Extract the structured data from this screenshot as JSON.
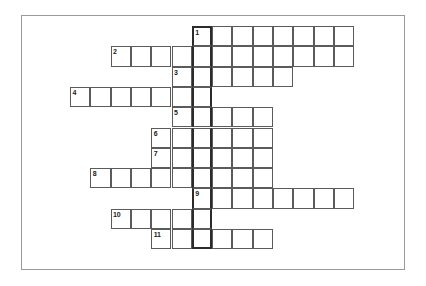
{
  "puzzle": {
    "type": "crossword-skeleton",
    "title": "",
    "grid": {
      "cell_size": 20.3,
      "origin_x": 70,
      "origin_y": 26,
      "key_column_index": 6,
      "key_column_style": "bold-outline",
      "border_color": "#5b5b5b",
      "key_border_color": "#2b2b2b",
      "frame_color": "#9a9a9a",
      "background": "#ffffff"
    },
    "rows": [
      {
        "number": "1",
        "row_index": 0,
        "start_col": 6,
        "length": 8
      },
      {
        "number": "2",
        "row_index": 1,
        "start_col": 2,
        "length": 12
      },
      {
        "number": "3",
        "row_index": 2,
        "start_col": 5,
        "length": 6
      },
      {
        "number": "4",
        "row_index": 3,
        "start_col": 0,
        "length": 7
      },
      {
        "number": "5",
        "row_index": 4,
        "start_col": 5,
        "length": 5
      },
      {
        "number": "6",
        "row_index": 5,
        "start_col": 4,
        "length": 6
      },
      {
        "number": "7",
        "row_index": 6,
        "start_col": 4,
        "length": 6
      },
      {
        "number": "8",
        "row_index": 7,
        "start_col": 1,
        "length": 9
      },
      {
        "number": "9",
        "row_index": 8,
        "start_col": 6,
        "length": 8
      },
      {
        "number": "10",
        "row_index": 9,
        "start_col": 2,
        "length": 5
      },
      {
        "number": "11",
        "row_index": 10,
        "start_col": 4,
        "length": 6
      }
    ]
  }
}
